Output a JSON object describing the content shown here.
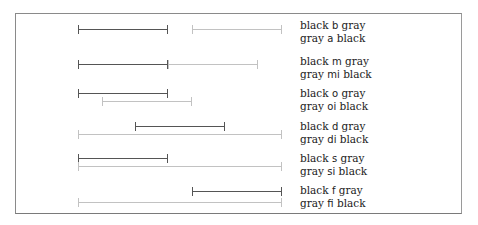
{
  "diagram": {
    "colors": {
      "black": "#555555",
      "gray": "#c2c2c2",
      "frame": "#8a8a8a"
    },
    "rows": [
      {
        "relation": "b",
        "inverse": "a",
        "line1": {
          "pre": "black",
          "rel": "b",
          "post": "gray"
        },
        "line2": {
          "pre": "gray",
          "rel": "a",
          "post": "black"
        },
        "black": {
          "x1": 78,
          "x2": 168,
          "y": 29
        },
        "gray": {
          "x1": 192,
          "x2": 282,
          "y": 29
        },
        "label_y": 19
      },
      {
        "relation": "m",
        "inverse": "mi",
        "line1": {
          "pre": "black",
          "rel": "m",
          "post": "gray"
        },
        "line2": {
          "pre": "gray",
          "rel": "mi",
          "post": "black"
        },
        "black": {
          "x1": 78,
          "x2": 168,
          "y": 64
        },
        "gray": {
          "x1": 168,
          "x2": 258,
          "y": 64
        },
        "label_y": 55
      },
      {
        "relation": "o",
        "inverse": "oi",
        "line1": {
          "pre": "black",
          "rel": "o",
          "post": "gray"
        },
        "line2": {
          "pre": "gray",
          "rel": "oi",
          "post": "black"
        },
        "black": {
          "x1": 78,
          "x2": 168,
          "y": 93
        },
        "gray": {
          "x1": 102,
          "x2": 192,
          "y": 101
        },
        "label_y": 87
      },
      {
        "relation": "d",
        "inverse": "di",
        "line1": {
          "pre": "black",
          "rel": "d",
          "post": "gray"
        },
        "line2": {
          "pre": "gray",
          "rel": "di",
          "post": "black"
        },
        "black": {
          "x1": 135,
          "x2": 225,
          "y": 126
        },
        "gray": {
          "x1": 78,
          "x2": 282,
          "y": 134
        },
        "label_y": 120
      },
      {
        "relation": "s",
        "inverse": "si",
        "line1": {
          "pre": "black",
          "rel": "s",
          "post": "gray"
        },
        "line2": {
          "pre": "gray",
          "rel": "si",
          "post": "black"
        },
        "black": {
          "x1": 78,
          "x2": 168,
          "y": 158
        },
        "gray": {
          "x1": 78,
          "x2": 282,
          "y": 166
        },
        "label_y": 152
      },
      {
        "relation": "f",
        "inverse": "fi",
        "line1": {
          "pre": "black",
          "rel": "f",
          "post": "gray"
        },
        "line2": {
          "pre": "gray",
          "rel": "fi",
          "post": "black"
        },
        "black": {
          "x1": 192,
          "x2": 282,
          "y": 191
        },
        "gray": {
          "x1": 78,
          "x2": 282,
          "y": 202
        },
        "label_y": 184
      }
    ]
  }
}
